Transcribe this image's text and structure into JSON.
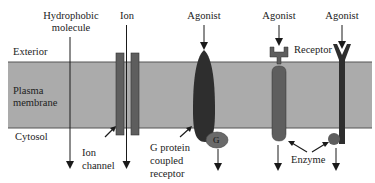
{
  "diagram": {
    "type": "membrane-signaling-mechanisms",
    "colors": {
      "membrane": "#ababab",
      "membrane_edge": "#555555",
      "protein_medium": "#5e5e5e",
      "protein_dark": "#2e2e2e",
      "g_protein": "#6a6a6a",
      "arrow": "#1a1a1a",
      "text": "#222222"
    },
    "regions": {
      "exterior": "Exterior",
      "membrane_line1": "Plasma",
      "membrane_line2": "membrane",
      "cytosol": "Cytosol"
    },
    "top_labels": {
      "hydrophobic_line1": "Hydrophobic",
      "hydrophobic_line2": "molecule",
      "ion": "Ion",
      "agonist_gpcr": "Agonist",
      "agonist_enzyme1": "Agonist",
      "agonist_enzyme2": "Agonist"
    },
    "component_labels": {
      "receptor": "Receptor",
      "ion_channel_line1": "Ion",
      "ion_channel_line2": "channel",
      "gpcr_line1": "G protein",
      "gpcr_line2": "coupled",
      "gpcr_line3": "receptor",
      "g_protein": "G",
      "enzyme": "Enzyme"
    }
  }
}
